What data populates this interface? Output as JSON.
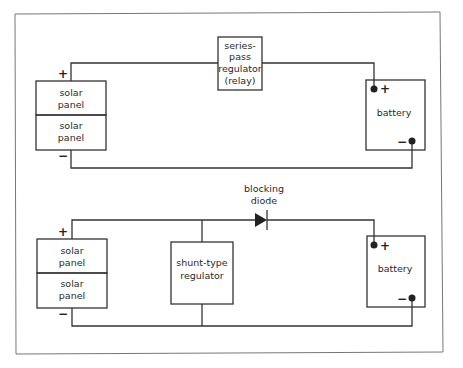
{
  "diagram": {
    "top_circuit": {
      "solar_panel_1": [
        "solar",
        "panel"
      ],
      "solar_panel_2": [
        "solar",
        "panel"
      ],
      "regulator": [
        "series-",
        "pass",
        "regulator",
        "(relay)"
      ],
      "battery": "battery",
      "panel_plus": "+",
      "panel_minus": "−",
      "battery_plus": "+",
      "battery_minus": "−"
    },
    "bottom_circuit": {
      "solar_panel_1": [
        "solar",
        "panel"
      ],
      "solar_panel_2": [
        "solar",
        "panel"
      ],
      "regulator": [
        "shunt-type",
        "regulator"
      ],
      "diode_label": [
        "blocking",
        "diode"
      ],
      "battery": "battery",
      "panel_plus": "+",
      "panel_minus": "−",
      "battery_plus": "+",
      "battery_minus": "−"
    }
  }
}
